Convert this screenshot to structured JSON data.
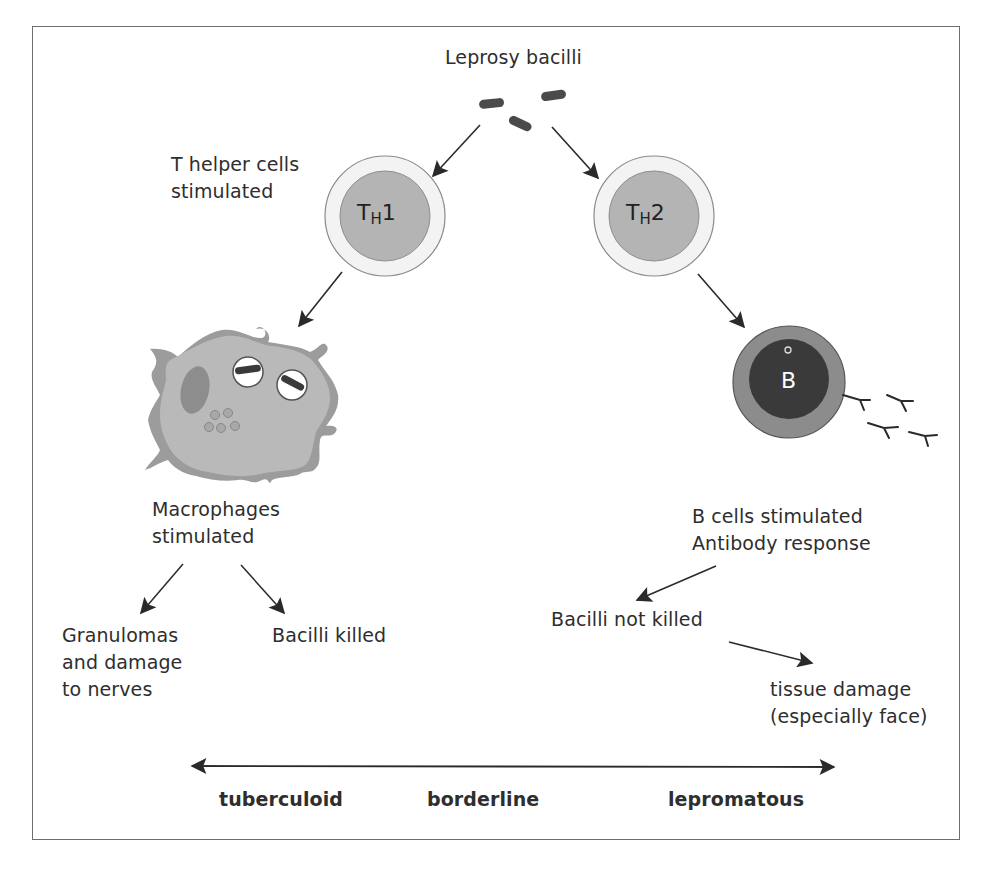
{
  "title": "Leprosy bacilli",
  "labels": {
    "t_helper": [
      "T helper cells",
      "stimulated"
    ],
    "th1": {
      "main": "T",
      "sub": "H",
      "suffix": "1"
    },
    "th2": {
      "main": "T",
      "sub": "H",
      "suffix": "2"
    },
    "b_cell": "B",
    "macrophages": [
      "Macrophages",
      "stimulated"
    ],
    "granulomas": [
      "Granulomas",
      "and damage",
      "to nerves"
    ],
    "bacilli_killed": "Bacilli killed",
    "b_cells_stimulated": [
      "B cells stimulated",
      "Antibody response"
    ],
    "bacilli_not_killed": "Bacilli not killed",
    "tissue_damage": [
      "tissue damage",
      "(especially face)"
    ]
  },
  "spectrum": {
    "left": "tuberculoid",
    "middle": "borderline",
    "right": "lepromatous"
  },
  "colors": {
    "border": "#6e6e6e",
    "arrow": "#2a2a2a",
    "bacillus": "#4a4a4a",
    "t_cell_outer": "#f2f2f2",
    "t_cell_inner": "#b4b4b4",
    "macrophage_outer": "#9c9c9c",
    "macrophage_inner": "#b9b9b9",
    "b_cell_outer": "#8c8c8c",
    "b_cell_inner": "#3a3a3a"
  }
}
